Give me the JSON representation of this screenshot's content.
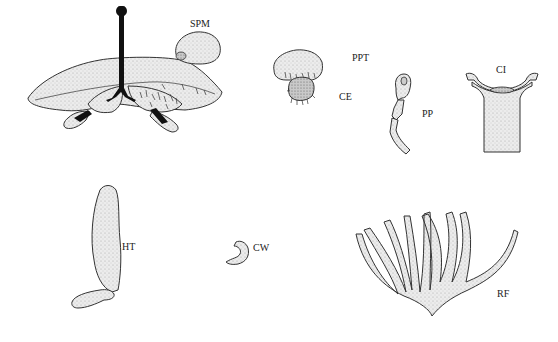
{
  "figure": {
    "labels": {
      "spm": "SPM",
      "ppt": "PPT",
      "ce": "CE",
      "pp": "PP",
      "ci": "CI",
      "ht": "HT",
      "cw": "CW",
      "rf": "RF"
    },
    "caption": ""
  }
}
